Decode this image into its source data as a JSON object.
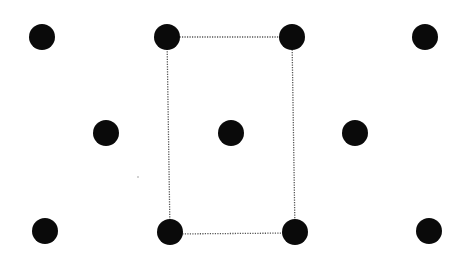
{
  "diagram": {
    "type": "centered-rectangular-lattice",
    "background": "#ffffff",
    "atom_color": "#0a0a0a",
    "atom_radius": 13,
    "cell_line_color": "#555555",
    "atoms": [
      {
        "row": 1,
        "x": 42,
        "y": 37
      },
      {
        "row": 1,
        "x": 167,
        "y": 37
      },
      {
        "row": 1,
        "x": 292,
        "y": 37
      },
      {
        "row": 1,
        "x": 425,
        "y": 37
      },
      {
        "row": 2,
        "x": 106,
        "y": 133
      },
      {
        "row": 2,
        "x": 231,
        "y": 133
      },
      {
        "row": 2,
        "x": 355,
        "y": 133
      },
      {
        "row": 3,
        "x": 45,
        "y": 231
      },
      {
        "row": 3,
        "x": 170,
        "y": 232
      },
      {
        "row": 3,
        "x": 295,
        "y": 232
      },
      {
        "row": 3,
        "x": 429,
        "y": 231
      }
    ],
    "unit_cell": {
      "style": "dotted",
      "corners": [
        [
          167,
          37
        ],
        [
          292,
          37
        ],
        [
          295,
          233
        ],
        [
          170,
          234
        ]
      ]
    },
    "specks": [
      {
        "x": 138,
        "y": 177
      }
    ]
  }
}
